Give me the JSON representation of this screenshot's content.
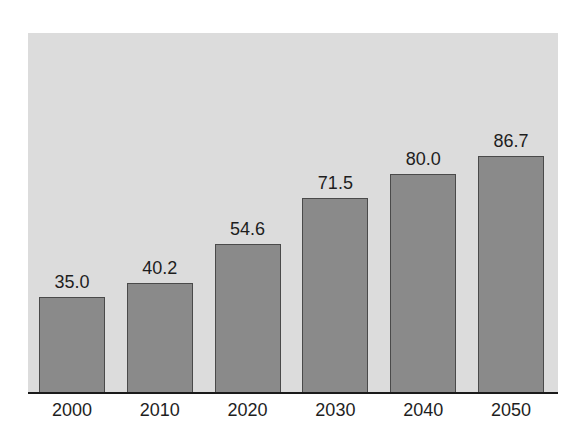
{
  "chart_data": {
    "type": "bar",
    "title": "",
    "xlabel": "",
    "ylabel": "",
    "categories": [
      "2000",
      "2010",
      "2020",
      "2030",
      "2040",
      "2050"
    ],
    "values": [
      35.0,
      40.2,
      54.6,
      71.5,
      80.0,
      86.7
    ],
    "value_labels": [
      "35.0",
      "40.2",
      "54.6",
      "71.5",
      "80.0",
      "86.7"
    ],
    "ylim": [
      0,
      100
    ],
    "grid": false,
    "legend": null,
    "colors": {
      "bar_fill": "#8a8a8a",
      "bar_edge": "#4a4a4a",
      "plot_background": "#dcdcdc",
      "axis": "#1a1a1a"
    }
  }
}
